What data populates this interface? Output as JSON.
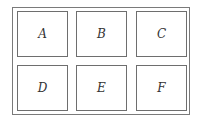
{
  "diagram": {
    "type": "grid",
    "rows": 2,
    "columns": 3,
    "cells": [
      {
        "label": "A",
        "x": 17,
        "y": 11
      },
      {
        "label": "B",
        "x": 76,
        "y": 11
      },
      {
        "label": "C",
        "x": 136,
        "y": 11
      },
      {
        "label": "D",
        "x": 17,
        "y": 65
      },
      {
        "label": "E",
        "x": 76,
        "y": 65
      },
      {
        "label": "F",
        "x": 136,
        "y": 65
      }
    ],
    "colors": {
      "border": "#6e6e6e",
      "text": "#333333",
      "background": "#ffffff"
    }
  }
}
